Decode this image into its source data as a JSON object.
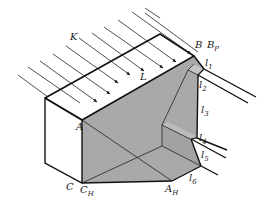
{
  "diagram": {
    "colors": {
      "stroke": "#111111",
      "ray": "#222222",
      "shadow_fill": "#a9a9a9",
      "light_face": "#ffffff",
      "background": "#ffffff"
    },
    "labels": {
      "K": "K",
      "L": "L",
      "A": "A",
      "B": "B",
      "Bp_main": "B",
      "Bp_sub": "P",
      "C": "C",
      "CH_main": "C",
      "CH_sub": "H",
      "AH_main": "A",
      "AH_sub": "H",
      "l1_main": "l",
      "l1_sub": "1",
      "l2_main": "l",
      "l2_sub": "2",
      "l3_main": "l",
      "l3_sub": "3",
      "l4_main": "l",
      "l4_sub": "4",
      "l5_main": "l",
      "l5_sub": "5",
      "l6_main": "l",
      "l6_sub": "6"
    }
  }
}
